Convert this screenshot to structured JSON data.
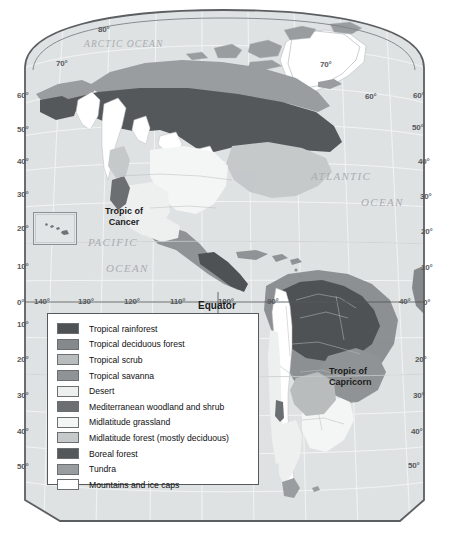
{
  "map": {
    "title_labels": {
      "equator": "Equator",
      "tropic_of_cancer_line1": "Tropic of",
      "tropic_of_cancer_line2": "Cancer",
      "tropic_of_capricorn_line1": "Tropic of",
      "tropic_of_capricorn_line2": "Capricorn"
    },
    "ocean_labels": [
      {
        "name": "arctic-ocean-label",
        "text": "ARCTIC  OCEAN",
        "x": 84,
        "y": 39,
        "size": "small"
      },
      {
        "name": "atlantic-ocean-label",
        "text": "ATLANTIC",
        "x": 311,
        "y": 170,
        "size": "normal"
      },
      {
        "name": "atlantic-ocean-label-2",
        "text": "OCEAN",
        "x": 361,
        "y": 196,
        "size": "normal"
      },
      {
        "name": "pacific-ocean-label",
        "text": "PACIFIC",
        "x": 88,
        "y": 236,
        "size": "normal"
      },
      {
        "name": "pacific-ocean-label-2",
        "text": "OCEAN",
        "x": 106,
        "y": 262,
        "size": "normal"
      }
    ],
    "latitude_labels_left": [
      {
        "text": "60°",
        "x": 17,
        "y": 91
      },
      {
        "text": "50°",
        "x": 17,
        "y": 125
      },
      {
        "text": "40°",
        "x": 17,
        "y": 157
      },
      {
        "text": "30°",
        "x": 17,
        "y": 190
      },
      {
        "text": "20°",
        "x": 17,
        "y": 224
      },
      {
        "text": "10°",
        "x": 17,
        "y": 262
      },
      {
        "text": "0°",
        "x": 17,
        "y": 298
      },
      {
        "text": "10°",
        "x": 17,
        "y": 320
      },
      {
        "text": "20°",
        "x": 17,
        "y": 355
      },
      {
        "text": "30°",
        "x": 17,
        "y": 391
      },
      {
        "text": "40°",
        "x": 17,
        "y": 427
      },
      {
        "text": "50°",
        "x": 17,
        "y": 462
      }
    ],
    "latitude_labels_right": [
      {
        "text": "60°",
        "x": 413,
        "y": 91
      },
      {
        "text": "50°",
        "x": 412,
        "y": 123
      },
      {
        "text": "40°",
        "x": 418,
        "y": 157
      },
      {
        "text": "30°",
        "x": 420,
        "y": 192
      },
      {
        "text": "20°",
        "x": 421,
        "y": 227
      },
      {
        "text": "10°",
        "x": 421,
        "y": 263
      },
      {
        "text": "0°",
        "x": 423,
        "y": 298
      },
      {
        "text": "20°",
        "x": 415,
        "y": 355
      },
      {
        "text": "30°",
        "x": 413,
        "y": 391
      },
      {
        "text": "40°",
        "x": 411,
        "y": 427
      },
      {
        "text": "50°",
        "x": 408,
        "y": 461
      }
    ],
    "latitude_labels_arc": [
      {
        "text": "80°",
        "x": 98,
        "y": 25
      },
      {
        "text": "70°",
        "x": 56,
        "y": 59
      },
      {
        "text": "70°",
        "x": 320,
        "y": 60
      },
      {
        "text": "60°",
        "x": 365,
        "y": 92
      }
    ],
    "longitude_labels": [
      {
        "text": "140°",
        "x": 34,
        "y": 297
      },
      {
        "text": "130°",
        "x": 78,
        "y": 297
      },
      {
        "text": "120°",
        "x": 124,
        "y": 297
      },
      {
        "text": "110°",
        "x": 170,
        "y": 297
      },
      {
        "text": "100°",
        "x": 218,
        "y": 297
      },
      {
        "text": "90°",
        "x": 267,
        "y": 297
      },
      {
        "text": "40°",
        "x": 399,
        "y": 297
      }
    ],
    "colors": {
      "ocean": "#dfe2e3",
      "map_outline": "#5b5f62",
      "graticule": "#f2f4f4",
      "country_border": "#b9bdbf"
    }
  },
  "legend": {
    "items": [
      {
        "label": "Tropical rainforest",
        "color": "#4f5254"
      },
      {
        "label": "Tropical deciduous forest",
        "color": "#86898b"
      },
      {
        "label": "Tropical scrub",
        "color": "#b9bcbd"
      },
      {
        "label": "Tropical savanna",
        "color": "#909395"
      },
      {
        "label": "Desert",
        "color": "#eef0f0"
      },
      {
        "label": "Mediterranean woodland and shrub",
        "color": "#6c6f71"
      },
      {
        "label": "Midlatitude grassland",
        "color": "#f4f6f6"
      },
      {
        "label": "Midlatitude forest (mostly deciduous)",
        "color": "#c6c9ca"
      },
      {
        "label": "Boreal forest",
        "color": "#55585a"
      },
      {
        "label": "Tundra",
        "color": "#9a9d9f"
      },
      {
        "label": "Mountains and ice caps",
        "color": "#ffffff"
      }
    ]
  }
}
